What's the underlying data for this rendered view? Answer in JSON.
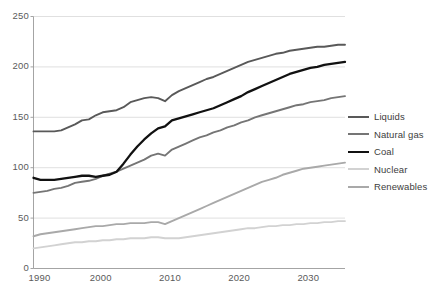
{
  "chart_data": {
    "type": "line",
    "title": "",
    "subtitle": "",
    "xlabel": "",
    "ylabel": "",
    "xlim": [
      1990,
      2035
    ],
    "ylim": [
      0,
      250
    ],
    "x_ticks": [
      1990,
      2000,
      2010,
      2020,
      2030
    ],
    "y_ticks": [
      0,
      50,
      100,
      150,
      200,
      250
    ],
    "grid": "horizontal",
    "legend_position": "right",
    "x": [
      1990,
      1991,
      1992,
      1993,
      1994,
      1995,
      1996,
      1997,
      1998,
      1999,
      2000,
      2001,
      2002,
      2003,
      2004,
      2005,
      2006,
      2007,
      2008,
      2009,
      2010,
      2011,
      2012,
      2013,
      2014,
      2015,
      2016,
      2017,
      2018,
      2019,
      2020,
      2021,
      2022,
      2023,
      2024,
      2025,
      2026,
      2027,
      2028,
      2029,
      2030,
      2031,
      2032,
      2033,
      2034,
      2035
    ],
    "series": [
      {
        "name": "Liquids",
        "color": "#595959",
        "values": [
          136,
          136,
          136,
          136,
          137,
          140,
          143,
          147,
          148,
          152,
          155,
          156,
          157,
          160,
          165,
          167,
          169,
          170,
          169,
          166,
          172,
          176,
          179,
          182,
          185,
          188,
          190,
          193,
          196,
          199,
          202,
          205,
          207,
          209,
          211,
          213,
          214,
          216,
          217,
          218,
          219,
          220,
          220,
          221,
          222,
          222
        ]
      },
      {
        "name": "Natural gas",
        "color": "#757575",
        "values": [
          75,
          76,
          77,
          79,
          80,
          82,
          85,
          86,
          87,
          89,
          92,
          94,
          96,
          99,
          102,
          105,
          108,
          112,
          114,
          112,
          118,
          121,
          124,
          127,
          130,
          132,
          135,
          137,
          140,
          142,
          145,
          147,
          150,
          152,
          154,
          156,
          158,
          160,
          162,
          163,
          165,
          166,
          167,
          169,
          170,
          171
        ]
      },
      {
        "name": "Coal",
        "color": "#111111",
        "values": [
          90,
          88,
          88,
          88,
          89,
          90,
          91,
          92,
          92,
          91,
          92,
          93,
          96,
          104,
          113,
          121,
          128,
          134,
          139,
          141,
          147,
          149,
          151,
          153,
          155,
          157,
          159,
          162,
          165,
          168,
          171,
          175,
          178,
          181,
          184,
          187,
          190,
          193,
          195,
          197,
          199,
          200,
          202,
          203,
          204,
          205
        ]
      },
      {
        "name": "Nuclear",
        "color": "#d2d2d2",
        "values": [
          20,
          21,
          22,
          23,
          24,
          25,
          26,
          26,
          27,
          27,
          28,
          28,
          29,
          29,
          30,
          30,
          30,
          31,
          31,
          30,
          30,
          30,
          31,
          32,
          33,
          34,
          35,
          36,
          37,
          38,
          39,
          40,
          40,
          41,
          42,
          42,
          43,
          43,
          44,
          44,
          45,
          45,
          46,
          46,
          47,
          47
        ]
      },
      {
        "name": "Renewables",
        "color": "#a9a9a9",
        "values": [
          32,
          34,
          35,
          36,
          37,
          38,
          39,
          40,
          41,
          42,
          42,
          43,
          44,
          44,
          45,
          45,
          45,
          46,
          46,
          44,
          47,
          50,
          53,
          56,
          59,
          62,
          65,
          68,
          71,
          74,
          77,
          80,
          83,
          86,
          88,
          90,
          93,
          95,
          97,
          99,
          100,
          101,
          102,
          103,
          104,
          105
        ]
      }
    ]
  },
  "axes": {
    "y_tick_labels": [
      "250",
      "200",
      "150",
      "100",
      "50",
      "0"
    ],
    "x_tick_labels": [
      "1990",
      "2000",
      "2010",
      "2020",
      "2030"
    ]
  },
  "legend": {
    "items": [
      {
        "label": "Liquids",
        "color": "#595959"
      },
      {
        "label": "Natural gas",
        "color": "#757575"
      },
      {
        "label": "Coal",
        "color": "#111111"
      },
      {
        "label": "Nuclear",
        "color": "#d2d2d2"
      },
      {
        "label": "Renewables",
        "color": "#a9a9a9"
      }
    ]
  },
  "style": {
    "axis_color": "#9a9a9a",
    "grid_color": "#d8d8d8",
    "tick_text_color": "#5a5a5a",
    "background": "#ffffff"
  }
}
